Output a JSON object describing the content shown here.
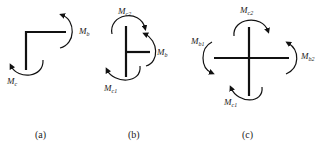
{
  "figure": {
    "panels": [
      {
        "id": "a",
        "caption": "(a)",
        "description": "Corner joint (L-shape) with two end moments",
        "moments": [
          {
            "symbol": "M",
            "subscript": "b",
            "position": "right"
          },
          {
            "symbol": "M",
            "subscript": "c",
            "position": "bottom-left"
          }
        ]
      },
      {
        "id": "b",
        "caption": "(b)",
        "description": "T-joint (exterior column joint) with three end moments",
        "moments": [
          {
            "symbol": "M",
            "subscript": "c2",
            "position": "top"
          },
          {
            "symbol": "M",
            "subscript": "b",
            "position": "right"
          },
          {
            "symbol": "M",
            "subscript": "c1",
            "position": "bottom-left"
          }
        ]
      },
      {
        "id": "c",
        "caption": "(c)",
        "description": "Cross joint (interior joint) with four end moments",
        "moments": [
          {
            "symbol": "M",
            "subscript": "c2",
            "position": "top"
          },
          {
            "symbol": "M",
            "subscript": "b1",
            "position": "left"
          },
          {
            "symbol": "M",
            "subscript": "b2",
            "position": "right"
          },
          {
            "symbol": "M",
            "subscript": "c1",
            "position": "bottom"
          }
        ]
      }
    ]
  }
}
